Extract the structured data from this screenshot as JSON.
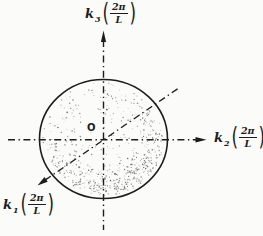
{
  "colors": {
    "background": "#fbfbf9",
    "ink": "#1d1d1d",
    "stipple": "#4a4a4a"
  },
  "origin": {
    "label": "O"
  },
  "axes": [
    {
      "id": "k3",
      "symbol": "k",
      "subscript": "3",
      "paren_open": "(",
      "numerator": "2π",
      "denominator": "L",
      "paren_close": ")",
      "direction": "up"
    },
    {
      "id": "k2",
      "symbol": "k",
      "subscript": "2",
      "paren_open": "(",
      "numerator": "2π",
      "denominator": "L",
      "paren_close": ")",
      "direction": "right"
    },
    {
      "id": "k1",
      "symbol": "k",
      "subscript": "1",
      "paren_open": "(",
      "numerator": "2π",
      "denominator": "L",
      "paren_close": ")",
      "direction": "down-left"
    }
  ],
  "sphere": {
    "filled_with": "stippled points"
  },
  "stipple": {
    "seed": 20,
    "count": 620
  }
}
